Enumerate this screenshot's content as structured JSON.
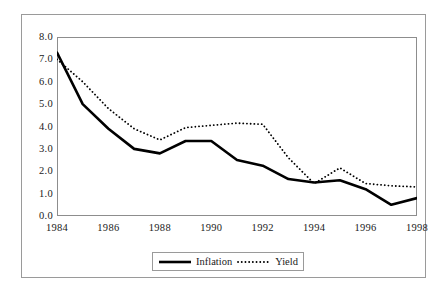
{
  "chart_data": {
    "type": "line",
    "title": "",
    "subtitle": "",
    "xlabel": "",
    "ylabel": "",
    "x": [
      1984,
      1985,
      1986,
      1987,
      1988,
      1989,
      1990,
      1991,
      1992,
      1993,
      1994,
      1995,
      1996,
      1997,
      1998
    ],
    "xlim": [
      1984,
      1998
    ],
    "ylim": [
      0.0,
      8.0
    ],
    "grid": false,
    "legend_position": "bottom-center",
    "x_tick_labels": [
      "1984",
      "1986",
      "1988",
      "1990",
      "1992",
      "1994",
      "1996",
      "1998"
    ],
    "x_tick_values": [
      1984,
      1986,
      1988,
      1990,
      1992,
      1994,
      1996,
      1998
    ],
    "y_tick_labels": [
      "0.0",
      "1.0",
      "2.0",
      "3.0",
      "4.0",
      "5.0",
      "6.0",
      "7.0",
      "8.0"
    ],
    "y_tick_values": [
      0.0,
      1.0,
      2.0,
      3.0,
      4.0,
      5.0,
      6.0,
      7.0,
      8.0
    ],
    "series": [
      {
        "name": "Inflation",
        "style": "solid",
        "color": "#000000",
        "width": 2.6,
        "values": [
          7.3,
          5.0,
          3.9,
          3.0,
          2.8,
          3.35,
          3.35,
          2.5,
          2.25,
          1.65,
          1.5,
          1.6,
          1.2,
          0.5,
          0.8
        ]
      },
      {
        "name": "Yield",
        "style": "dotted",
        "color": "#000000",
        "width": 1.8,
        "values": [
          7.0,
          6.0,
          4.8,
          3.9,
          3.4,
          3.95,
          4.05,
          4.15,
          4.1,
          2.6,
          1.45,
          2.15,
          1.45,
          1.35,
          1.3
        ]
      }
    ]
  },
  "legend": {
    "entries": [
      {
        "label": "Inflation",
        "style": "solid"
      },
      {
        "label": "Yield",
        "style": "dotted"
      }
    ]
  },
  "colors": {
    "series_line": "#000000",
    "frame": "#9a9a9a",
    "plot_border": "#8d8d8d",
    "text": "#1a1a1a",
    "background": "#ffffff"
  }
}
